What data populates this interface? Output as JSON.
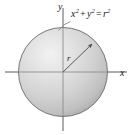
{
  "figure": {
    "background_color": "#ffffff",
    "width": 132,
    "height": 135
  },
  "axes": {
    "x_axis_label": "x",
    "y_axis_label": "y",
    "axis_color": "#555555",
    "origin": {
      "x": 63,
      "y": 72
    },
    "x_axis_extent": [
      5,
      127
    ],
    "y_axis_extent": [
      8,
      131
    ]
  },
  "circle": {
    "center": {
      "x": 63,
      "y": 72
    },
    "radius": 45,
    "outline_color": "#6e6e6e",
    "fill_light": "#ececec",
    "fill_mid": "#cfcfcf",
    "fill_dark": "#a9a9a9"
  },
  "radius": {
    "label": "r",
    "line_color": "#5a5a5a",
    "from": {
      "x": 63,
      "y": 72
    },
    "to": {
      "x": 94,
      "y": 42
    },
    "arrowhead": "arrow-up-right"
  },
  "annotation": {
    "equation_plain": "x^2 + y^2 = r^2",
    "equation_parts": {
      "x_base": "x",
      "x_exp": "2",
      "plus": "+",
      "y_base": "y",
      "y_exp": "2",
      "equals": "=",
      "r_base": "r",
      "r_exp": "2"
    },
    "leader_line_color": "#8a8a8a",
    "leader_from": {
      "x": 70,
      "y": 21
    },
    "leader_to": {
      "x": 59,
      "y": 30
    }
  }
}
